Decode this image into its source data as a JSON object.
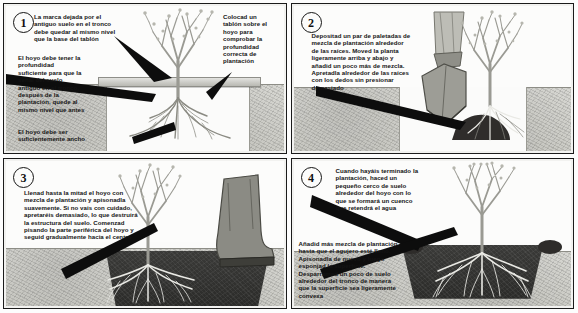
{
  "document": {
    "title": "Cómo plantar un árbol — secuencia de 4 pasos",
    "language": "es"
  },
  "panels": [
    {
      "number": "1",
      "captions": [
        {
          "id": "p1-c1",
          "name": "caption-soil-mark-level",
          "text": "La marca dejada por el\nantiguo suelo en el tronco\ndebe quedar al mismo nivel\nque la base del tablón"
        },
        {
          "id": "p1-c2",
          "name": "caption-hole-depth",
          "text": "El hoyo debe tener la\nprofundidad\nsuficiente para que la\nseñal del suelo\nantiguo en el tronco,\ndespués de la\nplantación, quede al\nmismo nivel que antes"
        },
        {
          "id": "p1-c3",
          "name": "caption-hole-width",
          "text": "El hoyo debe ser\nsuficientemente ancho"
        },
        {
          "id": "p1-c4",
          "name": "caption-plank-check",
          "text": "Colocad un\ntablón sobre el\nhoyo para\ncomprobar la\nprofundidad\ncorrecta de\nplantación"
        }
      ]
    },
    {
      "number": "2",
      "captions": [
        {
          "id": "p2-c1",
          "name": "caption-add-planting-mix",
          "text": "Depositad un par de paletadas de\nmezcla de plantación alrededor\nde las raíces. Moved la planta\nligeramente arriba y abajo y\nañadid un poco más de mezcla.\nApretadla alrededor de las raíces\ncon los dedos sin presionar\ndemasiado"
        }
      ]
    },
    {
      "number": "3",
      "captions": [
        {
          "id": "p3-c1",
          "name": "caption-fill-and-firm",
          "text": "Llenad hasta la mitad el hoyo con\nmezcla de plantación y apisonadla\nsuavemente. Si no vais con cuidado,\napretaréis demasiado, lo que destruirá\nla estructura del suelo. Comenzad\npisando la parte periférica del hoyo y\nseguid gradualmente hacia el centro"
        }
      ]
    },
    {
      "number": "4",
      "captions": [
        {
          "id": "p4-c1",
          "name": "caption-water-basin",
          "text": "Cuando hayáis terminado la\nplantación, haced un\npequeño cerco de suelo\nalrededor del hoyo con lo\nque se formará un cuenco\nque retendrá el agua"
        },
        {
          "id": "p4-c2",
          "name": "caption-top-up-and-level",
          "text": "Añadid más mezcla de plantación\nhasta que el agujero esté lleno.\nApisonadla de nuevo y luego\nesponjad la superficie.\nDesparramad un poco de suelo\nalrededor del tronco de manera\nque la superficie sea ligeramente\nconvexa"
        }
      ]
    }
  ],
  "colors": {
    "ink": "#111111",
    "border": "#1b1b1b",
    "ground": "#d4d4cf",
    "soil_dark": "#312f2d",
    "plank": "#cfcfc9",
    "paper": "#fbfbfa"
  }
}
